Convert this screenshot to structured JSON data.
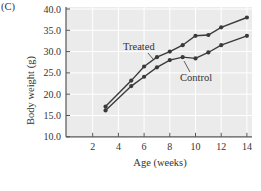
{
  "panel": {
    "label": "(C)"
  },
  "chart_data": {
    "type": "line",
    "title": "",
    "xlabel": "Age (weeks)",
    "ylabel": "Body weight (g)",
    "xlim": [
      0,
      14
    ],
    "ylim": [
      10.0,
      40.0
    ],
    "x_ticks": [
      2,
      4,
      6,
      8,
      10,
      12,
      14
    ],
    "y_ticks": [
      "10.0",
      "15.0",
      "20.0",
      "25.0",
      "30.0",
      "35.0",
      "40.0"
    ],
    "grid": true,
    "legend": "inline annotations",
    "x": [
      3,
      5,
      6,
      7,
      8,
      9,
      10,
      11,
      12,
      14
    ],
    "series": [
      {
        "name": "Treated",
        "values": [
          17.1,
          23.2,
          26.5,
          28.7,
          30.0,
          31.5,
          33.7,
          33.9,
          35.7,
          38.0
        ]
      },
      {
        "name": "Control",
        "values": [
          16.2,
          21.9,
          24.1,
          26.3,
          28.0,
          28.7,
          28.4,
          29.8,
          31.5,
          33.7
        ]
      }
    ],
    "annotations": [
      {
        "text": "Treated",
        "series": "Treated"
      },
      {
        "text": "Control",
        "series": "Control"
      }
    ]
  },
  "colors": {
    "plot_bg": "#ebebeb",
    "grid": "#ffffff",
    "line": "#3a3a3a",
    "axis": "#555555"
  }
}
